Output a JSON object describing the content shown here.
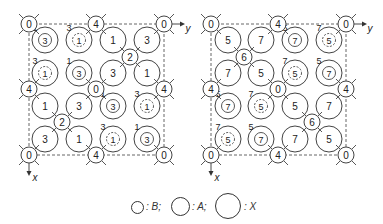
{
  "panels": [
    {
      "name": "left",
      "origin": [
        29,
        24
      ],
      "width": 135,
      "height": 131,
      "b_atoms": [
        {
          "x": 29,
          "y": 24,
          "label": "0"
        },
        {
          "x": 96,
          "y": 24,
          "label": "4"
        },
        {
          "x": 164,
          "y": 24,
          "label": "0"
        },
        {
          "x": 130,
          "y": 57,
          "label": "2"
        },
        {
          "x": 29,
          "y": 89,
          "label": "4"
        },
        {
          "x": 96,
          "y": 89,
          "label": "0"
        },
        {
          "x": 164,
          "y": 89,
          "label": "4"
        },
        {
          "x": 62,
          "y": 122,
          "label": "2"
        },
        {
          "x": 29,
          "y": 155,
          "label": "0"
        },
        {
          "x": 96,
          "y": 155,
          "label": "4"
        },
        {
          "x": 164,
          "y": 155,
          "label": "0"
        }
      ],
      "x_atoms": [
        {
          "x": 45,
          "y": 40,
          "label": "3",
          "inner": "solid",
          "sup": "1"
        },
        {
          "x": 79,
          "y": 40,
          "label": "1",
          "inner": "dashed",
          "sup": "3"
        },
        {
          "x": 113,
          "y": 40,
          "label": "1"
        },
        {
          "x": 147,
          "y": 40,
          "label": "3"
        },
        {
          "x": 45,
          "y": 73,
          "label": "1",
          "inner": "dashed",
          "sup": "3"
        },
        {
          "x": 79,
          "y": 73,
          "label": "3",
          "inner": "solid",
          "sup": "1"
        },
        {
          "x": 113,
          "y": 73,
          "label": "3"
        },
        {
          "x": 147,
          "y": 73,
          "label": "1"
        },
        {
          "x": 45,
          "y": 106,
          "label": "1"
        },
        {
          "x": 79,
          "y": 106,
          "label": "3"
        },
        {
          "x": 113,
          "y": 106,
          "label": "3",
          "inner": "solid",
          "sup": "1"
        },
        {
          "x": 147,
          "y": 106,
          "label": "1",
          "inner": "dashed",
          "sup": "3"
        },
        {
          "x": 45,
          "y": 139,
          "label": "3"
        },
        {
          "x": 79,
          "y": 139,
          "label": "1"
        },
        {
          "x": 113,
          "y": 139,
          "label": "1",
          "inner": "dashed",
          "sup": "3"
        },
        {
          "x": 147,
          "y": 139,
          "label": "3",
          "inner": "solid",
          "sup": "1"
        }
      ]
    },
    {
      "name": "right",
      "origin": [
        211,
        24
      ],
      "width": 135,
      "height": 131,
      "b_atoms": [
        {
          "x": 211,
          "y": 24,
          "label": "0"
        },
        {
          "x": 278,
          "y": 24,
          "label": "4"
        },
        {
          "x": 346,
          "y": 24,
          "label": "0"
        },
        {
          "x": 244,
          "y": 57,
          "label": "6"
        },
        {
          "x": 211,
          "y": 89,
          "label": "4"
        },
        {
          "x": 278,
          "y": 89,
          "label": "0"
        },
        {
          "x": 346,
          "y": 89,
          "label": "4"
        },
        {
          "x": 312,
          "y": 122,
          "label": "6"
        },
        {
          "x": 211,
          "y": 155,
          "label": "0"
        },
        {
          "x": 278,
          "y": 155,
          "label": "4"
        },
        {
          "x": 346,
          "y": 155,
          "label": "0"
        }
      ],
      "x_atoms": [
        {
          "x": 228,
          "y": 40,
          "label": "5"
        },
        {
          "x": 261,
          "y": 40,
          "label": "7"
        },
        {
          "x": 295,
          "y": 40,
          "label": "7",
          "inner": "solid",
          "sup": "5"
        },
        {
          "x": 329,
          "y": 40,
          "label": "5",
          "inner": "dashed",
          "sup": "7"
        },
        {
          "x": 228,
          "y": 73,
          "label": "7"
        },
        {
          "x": 261,
          "y": 73,
          "label": "5"
        },
        {
          "x": 295,
          "y": 73,
          "label": "5",
          "inner": "dashed",
          "sup": "7"
        },
        {
          "x": 329,
          "y": 73,
          "label": "7",
          "inner": "solid",
          "sup": "5"
        },
        {
          "x": 228,
          "y": 106,
          "label": "7",
          "inner": "solid",
          "sup": "5"
        },
        {
          "x": 261,
          "y": 106,
          "label": "5",
          "inner": "dashed",
          "sup": "7"
        },
        {
          "x": 295,
          "y": 106,
          "label": "5"
        },
        {
          "x": 329,
          "y": 106,
          "label": "7"
        },
        {
          "x": 228,
          "y": 139,
          "label": "5",
          "inner": "dashed",
          "sup": "7"
        },
        {
          "x": 261,
          "y": 139,
          "label": "7",
          "inner": "solid",
          "sup": "5"
        },
        {
          "x": 295,
          "y": 139,
          "label": "7"
        },
        {
          "x": 329,
          "y": 139,
          "label": "5"
        }
      ]
    }
  ],
  "axes": {
    "y_label": "y",
    "x_label": "x"
  },
  "legend": [
    {
      "symbol": "small-circle",
      "label": ": B;"
    },
    {
      "symbol": "medium-circle",
      "label": ": A;"
    },
    {
      "symbol": "large-circle",
      "label": ": X"
    }
  ]
}
